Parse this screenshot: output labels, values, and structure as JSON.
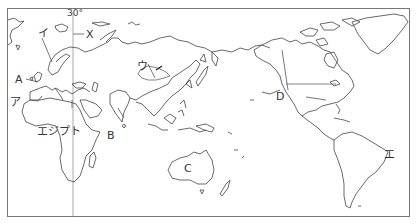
{
  "map": {
    "projection": "Pacific-centered world outline map",
    "caption_partial": "（ ）",
    "meridian": {
      "label": "30°",
      "x": 73
    },
    "labels": {
      "x": "X",
      "i": "イ",
      "a": "A",
      "ア": "ア",
      "egypt": "エジプト",
      "b": "B",
      "u": "ウ",
      "c": "C",
      "d": "D",
      "e": "エ"
    },
    "colors": {
      "line": "#444444",
      "frame": "#777777",
      "background": "#ffffff"
    }
  }
}
